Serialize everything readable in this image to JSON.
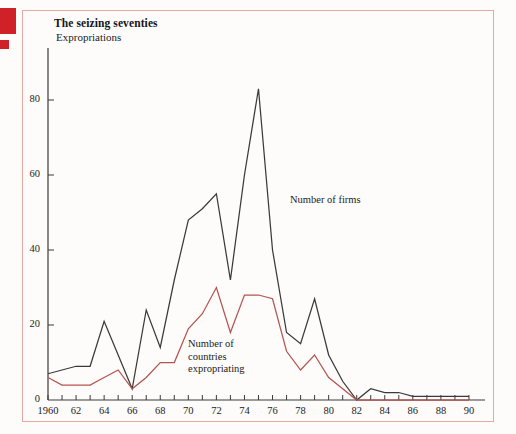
{
  "figure": {
    "title": "The seizing seventies",
    "subtitle": "Expropriations",
    "frame_color": "#e8a9a4",
    "background_color": "#fdfcfa",
    "marker_color": "#cf2127"
  },
  "annotations": {
    "firms_label": "Number of firms",
    "countries_label": "Number of\ncountries\nexpropriating"
  },
  "chart_data": {
    "type": "line",
    "title": "The seizing seventies",
    "subtitle": "Expropriations",
    "xlabel": "",
    "ylabel": "",
    "xlim": [
      1960,
      1991
    ],
    "ylim": [
      0,
      92
    ],
    "grid": false,
    "legend": "inline-annotations",
    "yticks": [
      0,
      20,
      40,
      60,
      80
    ],
    "ytick_labels": [
      "0",
      "20",
      "40",
      "60",
      "80"
    ],
    "xticks": [
      1960,
      1961,
      1962,
      1963,
      1964,
      1965,
      1966,
      1967,
      1968,
      1969,
      1970,
      1971,
      1972,
      1973,
      1974,
      1975,
      1976,
      1977,
      1978,
      1979,
      1980,
      1981,
      1982,
      1983,
      1984,
      1985,
      1986,
      1987,
      1988,
      1989,
      1990
    ],
    "xtick_labels": [
      "1960",
      "62",
      "64",
      "66",
      "68",
      "70",
      "72",
      "74",
      "76",
      "78",
      "80",
      "82",
      "84",
      "86",
      "88",
      "90"
    ],
    "xtick_label_years": [
      1960,
      1962,
      1964,
      1966,
      1968,
      1970,
      1972,
      1974,
      1976,
      1978,
      1980,
      1982,
      1984,
      1986,
      1988,
      1990
    ],
    "x": [
      1960,
      1961,
      1962,
      1963,
      1964,
      1965,
      1966,
      1967,
      1968,
      1969,
      1970,
      1971,
      1972,
      1973,
      1974,
      1975,
      1976,
      1977,
      1978,
      1979,
      1980,
      1981,
      1982,
      1983,
      1984,
      1985,
      1986,
      1987,
      1988,
      1989,
      1990
    ],
    "series": [
      {
        "name": "Number of firms",
        "color": "#3a3a3a",
        "values": [
          7,
          8,
          9,
          9,
          21,
          12,
          3,
          24,
          14,
          32,
          48,
          51,
          55,
          32,
          60,
          83,
          40,
          18,
          15,
          27,
          12,
          5,
          0,
          3,
          2,
          2,
          1,
          1,
          1,
          1,
          1
        ]
      },
      {
        "name": "Number of countries expropriating",
        "color": "#b5544f",
        "values": [
          6,
          4,
          4,
          4,
          6,
          8,
          3,
          6,
          10,
          10,
          19,
          23,
          30,
          18,
          28,
          28,
          27,
          13,
          8,
          12,
          6,
          3,
          0,
          0,
          0,
          0,
          0,
          0,
          0,
          0,
          0
        ]
      }
    ]
  }
}
